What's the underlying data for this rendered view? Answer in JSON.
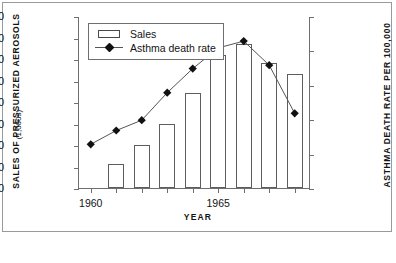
{
  "chart_data": {
    "type": "bar",
    "title": "",
    "subtitle": "",
    "xlabel": "YEAR",
    "ylabel": "SALES OF PRESSURIZED AEROSOLS",
    "ylabel_sub": "(1,000s)",
    "y2label": "ASTHMA DEATH RATE PER 100,000",
    "grid": false,
    "legend_position": "top-left",
    "x": [
      1960,
      1961,
      1962,
      1963,
      1964,
      1965,
      1966,
      1967,
      1968
    ],
    "categories": [
      "1960",
      "1961",
      "1962",
      "1963",
      "1964",
      "1965",
      "1966",
      "1967",
      "1968"
    ],
    "xtick_labels": [
      "1960",
      "",
      "",
      "",
      "",
      "1965",
      "",
      "",
      ""
    ],
    "xtick_values": [
      1960,
      1961,
      1962,
      1963,
      1964,
      1965,
      1966,
      1967,
      1968
    ],
    "xlim": [
      1959.5,
      1968.6
    ],
    "ylim": [
      0,
      800
    ],
    "ytick_labels": [
      "800",
      "700",
      "600",
      "500",
      "400",
      "300",
      "200",
      "100",
      "0"
    ],
    "ytick_values": [
      800,
      700,
      600,
      500,
      400,
      300,
      200,
      100,
      0
    ],
    "y2lim": [
      0,
      2.5
    ],
    "y2tick_labels": [
      "2.5",
      "2",
      "1.5",
      "1",
      "0.5",
      "0"
    ],
    "y2tick_values": [
      2.5,
      2,
      1.5,
      1,
      0.5,
      0
    ],
    "series": [
      {
        "name": "Sales",
        "type": "bar",
        "axis": "left",
        "units": "thousands of units",
        "values": [
          0,
          110,
          200,
          300,
          440,
          620,
          670,
          580,
          530
        ]
      },
      {
        "name": "Asthma death rate",
        "type": "line",
        "axis": "right",
        "units": "deaths per 100,000",
        "marker": "diamond",
        "values": [
          0.65,
          0.85,
          1.0,
          1.4,
          1.75,
          2.05,
          2.15,
          1.8,
          1.1
        ]
      }
    ],
    "legend": [
      {
        "label": "Sales",
        "key": "bar-swatch"
      },
      {
        "label": "Asthma death rate",
        "key": "line-diamond-marker"
      }
    ],
    "colors": {
      "bar_fill": "#ffffff",
      "bar_stroke": "#5d5d5d",
      "line": "#555555",
      "marker": "#111111",
      "axis": "#6f6f6f",
      "frame": "#9a9a9a",
      "text": "#141414",
      "background": "#ffffff"
    }
  }
}
